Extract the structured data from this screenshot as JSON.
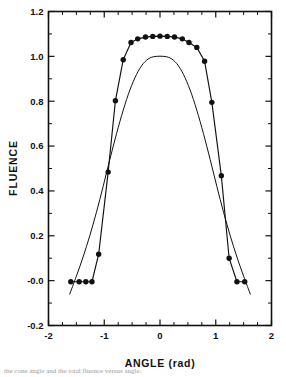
{
  "figure": {
    "background": "#ffffff",
    "ink_color": "#111111",
    "caption_fragment": "the cone angle and the total fluence versus angle."
  },
  "chart_data": {
    "type": "line",
    "title": "",
    "xlabel": "ANGLE (rad)",
    "ylabel": "FLUENCE",
    "xlim": [
      -2,
      2
    ],
    "ylim": [
      -0.2,
      1.2
    ],
    "grid": false,
    "legend": "none",
    "xticks": [
      -2,
      -1,
      0,
      1,
      2
    ],
    "xticklabels": [
      "-2",
      "-1",
      "0",
      "1",
      "2"
    ],
    "xtick_minor_step": 0.25,
    "yticks": [
      -0.2,
      0.0,
      0.2,
      0.4,
      0.6,
      0.8,
      1.0,
      1.2
    ],
    "yticklabels": [
      "-0.2",
      "-0.0",
      "0.2",
      "0.4",
      "0.6",
      "0.8",
      "1.0",
      "1.2"
    ],
    "ytick_minor_step": 0.1,
    "series": [
      {
        "name": "measured-fluence",
        "style": "line-with-markers",
        "marker": "filled-circle",
        "x": [
          -1.6,
          -1.45,
          -1.33,
          -1.22,
          -1.1,
          -0.93,
          -0.8,
          -0.66,
          -0.52,
          -0.4,
          -0.26,
          -0.13,
          0.0,
          0.13,
          0.26,
          0.4,
          0.52,
          0.66,
          0.8,
          0.93,
          1.1,
          1.24,
          1.38,
          1.52
        ],
        "y": [
          -0.005,
          -0.005,
          -0.005,
          -0.005,
          0.118,
          0.484,
          0.802,
          0.985,
          1.062,
          1.078,
          1.086,
          1.089,
          1.09,
          1.089,
          1.086,
          1.078,
          1.062,
          1.04,
          0.978,
          0.795,
          0.468,
          0.1,
          -0.005,
          -0.005
        ]
      },
      {
        "name": "model-fluence",
        "style": "smooth-line",
        "marker": "none",
        "x": [
          -1.62,
          -1.5,
          -1.38,
          -1.26,
          -1.14,
          -1.02,
          -0.9,
          -0.78,
          -0.66,
          -0.54,
          -0.42,
          -0.3,
          -0.18,
          -0.06,
          0.06,
          0.18,
          0.3,
          0.42,
          0.54,
          0.66,
          0.78,
          0.9,
          1.02,
          1.14,
          1.26,
          1.38,
          1.5,
          1.62
        ],
        "y": [
          -0.06,
          0.02,
          0.105,
          0.2,
          0.305,
          0.42,
          0.54,
          0.655,
          0.76,
          0.85,
          0.92,
          0.968,
          0.993,
          1.0,
          1.0,
          0.993,
          0.968,
          0.92,
          0.85,
          0.76,
          0.655,
          0.54,
          0.42,
          0.305,
          0.2,
          0.105,
          0.02,
          -0.06
        ]
      }
    ]
  }
}
